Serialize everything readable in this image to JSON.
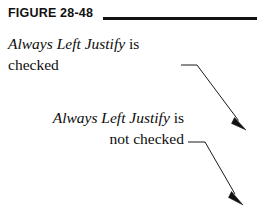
{
  "figure": {
    "label": "FIGURE 28-48",
    "rule": {
      "color": "#111111",
      "x": 103,
      "y": 17,
      "width": 154,
      "thickness": 3
    }
  },
  "callouts": [
    {
      "id": "checked",
      "align": "left",
      "lines": [
        {
          "italic": "Always Left Justify",
          "roman": " is"
        },
        {
          "italic": "",
          "roman": "checked"
        }
      ],
      "italic_text": "Always Left Justify",
      "roman_tail": " is",
      "second_line": "checked"
    },
    {
      "id": "not-checked",
      "align": "right",
      "lines": [
        {
          "italic": "Always Left Justify",
          "roman": " is"
        },
        {
          "italic": "",
          "roman": "not checked"
        }
      ],
      "italic_text": "Always Left Justify",
      "roman_tail": " is",
      "second_line": "not checked"
    }
  ],
  "arrows": [
    {
      "id": "arrow-checked",
      "color": "#1a1a1a",
      "stroke_width": 1,
      "leader_start": [
        181,
        65
      ],
      "elbow": [
        197,
        65
      ],
      "tip": [
        246,
        130
      ]
    },
    {
      "id": "arrow-not-checked",
      "color": "#1a1a1a",
      "stroke_width": 1,
      "leader_start": [
        188,
        142
      ],
      "elbow": [
        205,
        142
      ],
      "tip": [
        243,
        205
      ]
    }
  ],
  "colors": {
    "background": "#ffffff",
    "ink": "#0d0d0d",
    "rule": "#111111",
    "arrow": "#1a1a1a"
  }
}
